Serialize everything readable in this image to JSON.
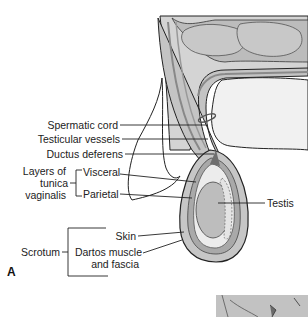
{
  "figure": {
    "panel_label": "A",
    "labels": {
      "spermatic_cord": "Spermatic cord",
      "testicular_vessels": "Testicular vessels",
      "ductus_deferens": "Ductus deferens",
      "tunica_group_line1": "Layers of",
      "tunica_group_line2": "tunica",
      "tunica_group_line3": "vaginalis",
      "visceral": "Visceral",
      "parietal": "Parietal",
      "testis": "Testis",
      "skin": "Skin",
      "scrotum": "Scrotum",
      "dartos_line1": "Dartos muscle",
      "dartos_line2": "and fascia"
    },
    "colors": {
      "tissue_light": "#d9d9d9",
      "tissue_mid": "#bdbdbd",
      "tissue_dark": "#8a8a8a",
      "outline": "#222222",
      "background": "#ffffff"
    }
  }
}
